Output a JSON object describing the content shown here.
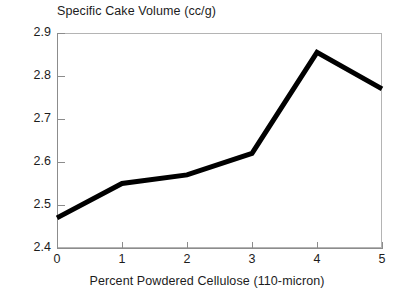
{
  "chart_data": {
    "type": "line",
    "title": "Specific Cake Volume (cc/g)",
    "xlabel": "Percent Powdered Cellulose (110-micron)",
    "ylabel": "",
    "x": [
      0,
      1,
      2,
      3,
      4,
      5
    ],
    "values": [
      2.47,
      2.55,
      2.57,
      2.62,
      2.855,
      2.77
    ],
    "series": [
      {
        "name": "Specific Cake Volume",
        "values": [
          2.47,
          2.55,
          2.57,
          2.62,
          2.855,
          2.77
        ]
      }
    ],
    "xlim": [
      0,
      5
    ],
    "ylim": [
      2.4,
      2.9
    ],
    "xticks": [
      "0",
      "1",
      "2",
      "3",
      "4",
      "5"
    ],
    "yticks": [
      "2.4",
      "2.5",
      "2.6",
      "2.7",
      "2.8",
      "2.9"
    ],
    "grid": false,
    "legend": null,
    "line_color": "#000000",
    "axis_color": "#8c8c8c",
    "frame_color": "#b4b4b4",
    "background": "#ffffff"
  }
}
